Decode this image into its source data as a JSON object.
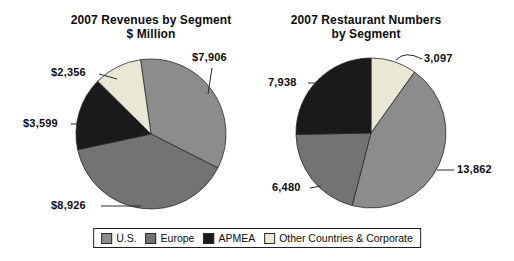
{
  "figure_description": "Two pie charts with shared legend",
  "chart_data": [
    {
      "type": "pie",
      "title": "2007 Revenues by Segment",
      "subtitle": "$ Million",
      "segments": [
        {
          "name": "U.S.",
          "value": 7906,
          "label": "$7,906",
          "color": "#8c8c8c"
        },
        {
          "name": "Europe",
          "value": 8926,
          "label": "$8,926",
          "color": "#737373"
        },
        {
          "name": "APMEA",
          "value": 3599,
          "label": "$3,599",
          "color": "#1a1a1a"
        },
        {
          "name": "Other Countries & Corporate",
          "value": 2356,
          "label": "$2,356",
          "color": "#eae7d4"
        }
      ],
      "total": 22787,
      "start_angle_deg": -8,
      "draw_order": [
        0,
        1,
        2,
        3
      ],
      "legend_position": "bottom-shared"
    },
    {
      "type": "pie",
      "title": "2007 Restaurant Numbers",
      "subtitle": "by Segment",
      "segments": [
        {
          "name": "U.S.",
          "value": 13862,
          "label": "13,862",
          "color": "#8c8c8c"
        },
        {
          "name": "Europe",
          "value": 6480,
          "label": "6,480",
          "color": "#737373"
        },
        {
          "name": "APMEA",
          "value": 7938,
          "label": "7,938",
          "color": "#1a1a1a"
        },
        {
          "name": "Other Countries & Corporate",
          "value": 3097,
          "label": "3,097",
          "color": "#eae7d4"
        }
      ],
      "total": 31377,
      "start_angle_deg": 0,
      "draw_order": [
        3,
        0,
        1,
        2
      ],
      "legend_position": "bottom-shared"
    }
  ],
  "legend": {
    "items": [
      {
        "label": "U.S.",
        "color": "#8c8c8c"
      },
      {
        "label": "Europe",
        "color": "#737373"
      },
      {
        "label": "APMEA",
        "color": "#1a1a1a"
      },
      {
        "label": "Other Countries & Corporate",
        "color": "#eae7d4"
      }
    ]
  },
  "colors": {
    "background": "#ffffff",
    "text": "#0d0d0d",
    "slice_outline": "#2b2b2b",
    "legend_border": "#1f1f1f"
  }
}
